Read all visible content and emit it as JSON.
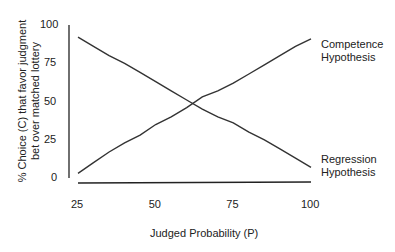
{
  "chart_data": {
    "type": "line",
    "title": "",
    "xlabel": "Judged Probability (P)",
    "ylabel": "% Choice (C) that favor judgment bet over matched lottery",
    "xlim": [
      25,
      100
    ],
    "ylim": [
      0,
      100
    ],
    "xticks": [
      25,
      50,
      75,
      100
    ],
    "yticks": [
      0,
      25,
      50,
      75,
      100
    ],
    "grid": false,
    "legend_position": "inline-right",
    "x": [
      25,
      30,
      35,
      40,
      45,
      50,
      55,
      60,
      65,
      70,
      75,
      80,
      85,
      90,
      95,
      100
    ],
    "series": [
      {
        "name": "Competence Hypothesis",
        "values": [
          3,
          10,
          17,
          23,
          28,
          35,
          40,
          46,
          53,
          57,
          62,
          68,
          74,
          80,
          86,
          91
        ]
      },
      {
        "name": "Regression Hypothesis",
        "values": [
          92,
          86,
          80,
          75,
          69,
          63,
          57,
          51,
          45,
          40,
          36,
          30,
          25,
          19,
          13,
          7
        ]
      }
    ]
  },
  "labels": {
    "competence": [
      "Competence",
      "Hypothesis"
    ],
    "regression": [
      "Regression",
      "Hypothesis"
    ]
  }
}
